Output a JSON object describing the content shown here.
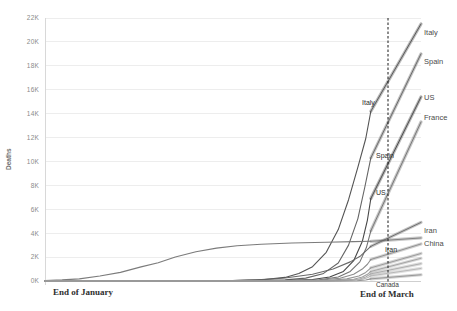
{
  "chart_data": {
    "type": "line",
    "title": "",
    "xlabel": "",
    "ylabel": "Deaths",
    "ylim": [
      0,
      22000
    ],
    "grid": true,
    "legend_position": "right-of-plot-inline-labels",
    "y_ticks": [
      "0K",
      "2K",
      "4K",
      "6K",
      "8K",
      "10K",
      "12K",
      "14K",
      "16K",
      "18K",
      "20K",
      "22K"
    ],
    "y_tick_values": [
      0,
      2000,
      4000,
      6000,
      8000,
      10000,
      12000,
      14000,
      16000,
      18000,
      20000,
      22000
    ],
    "x_annotations": [
      {
        "label": "End of January",
        "x_frac": 0.07
      },
      {
        "label": "End of March",
        "x_frac": 0.95
      }
    ],
    "now_marker": {
      "label": "End of March",
      "x_frac": 0.95
    },
    "x_domain_note": "Time from before End of January through End of March, with short projections past End of March",
    "series": [
      {
        "name": "Italy",
        "color": "#4a4a4a",
        "end_value": 14200,
        "projection_end_value": 21500,
        "points": [
          [
            0.0,
            0
          ],
          [
            0.2,
            0
          ],
          [
            0.4,
            10
          ],
          [
            0.55,
            40
          ],
          [
            0.64,
            120
          ],
          [
            0.7,
            300
          ],
          [
            0.74,
            620
          ],
          [
            0.78,
            1200
          ],
          [
            0.82,
            2400
          ],
          [
            0.855,
            4300
          ],
          [
            0.885,
            6800
          ],
          [
            0.912,
            9500
          ],
          [
            0.935,
            11900
          ],
          [
            0.95,
            14200
          ]
        ]
      },
      {
        "name": "Spain",
        "color": "#5c5c5c",
        "end_value": 10300,
        "projection_end_value": 19000,
        "points": [
          [
            0.0,
            0
          ],
          [
            0.3,
            0
          ],
          [
            0.5,
            10
          ],
          [
            0.62,
            30
          ],
          [
            0.7,
            90
          ],
          [
            0.76,
            240
          ],
          [
            0.81,
            600
          ],
          [
            0.855,
            1500
          ],
          [
            0.885,
            3000
          ],
          [
            0.912,
            5200
          ],
          [
            0.932,
            7800
          ],
          [
            0.95,
            10300
          ]
        ]
      },
      {
        "name": "US",
        "color": "#3d3d3d",
        "end_value": 6900,
        "projection_end_value": 15400,
        "points": [
          [
            0.0,
            0
          ],
          [
            0.45,
            0
          ],
          [
            0.6,
            15
          ],
          [
            0.7,
            45
          ],
          [
            0.78,
            120
          ],
          [
            0.83,
            330
          ],
          [
            0.87,
            800
          ],
          [
            0.9,
            1700
          ],
          [
            0.925,
            3300
          ],
          [
            0.94,
            5100
          ],
          [
            0.95,
            6900
          ]
        ]
      },
      {
        "name": "France",
        "color": "#6b6b6b",
        "end_value": 4200,
        "projection_end_value": 13300,
        "points": [
          [
            0.0,
            0
          ],
          [
            0.45,
            0
          ],
          [
            0.62,
            10
          ],
          [
            0.72,
            35
          ],
          [
            0.8,
            110
          ],
          [
            0.855,
            330
          ],
          [
            0.89,
            800
          ],
          [
            0.918,
            1600
          ],
          [
            0.937,
            2800
          ],
          [
            0.95,
            4200
          ]
        ]
      },
      {
        "name": "China",
        "color": "#747474",
        "end_value": 3320,
        "projection_end_value": 3600,
        "points": [
          [
            0.0,
            40
          ],
          [
            0.05,
            90
          ],
          [
            0.1,
            180
          ],
          [
            0.16,
            420
          ],
          [
            0.22,
            720
          ],
          [
            0.28,
            1180
          ],
          [
            0.33,
            1520
          ],
          [
            0.38,
            2000
          ],
          [
            0.44,
            2450
          ],
          [
            0.5,
            2750
          ],
          [
            0.56,
            2950
          ],
          [
            0.63,
            3080
          ],
          [
            0.72,
            3180
          ],
          [
            0.82,
            3240
          ],
          [
            0.9,
            3290
          ],
          [
            0.95,
            3320
          ]
        ]
      },
      {
        "name": "Iran",
        "color": "#616161",
        "end_value": 2900,
        "projection_end_value": 4900,
        "points": [
          [
            0.0,
            0
          ],
          [
            0.4,
            0
          ],
          [
            0.52,
            20
          ],
          [
            0.62,
            90
          ],
          [
            0.7,
            250
          ],
          [
            0.78,
            560
          ],
          [
            0.84,
            1000
          ],
          [
            0.89,
            1600
          ],
          [
            0.92,
            2100
          ],
          [
            0.95,
            2900
          ]
        ]
      },
      {
        "name": "UK",
        "color": "#858585",
        "end_value": 1800,
        "projection_end_value": 3100,
        "points": [
          [
            0.0,
            0
          ],
          [
            0.55,
            0
          ],
          [
            0.7,
            15
          ],
          [
            0.8,
            70
          ],
          [
            0.86,
            230
          ],
          [
            0.9,
            560
          ],
          [
            0.925,
            1000
          ],
          [
            0.94,
            1400
          ],
          [
            0.95,
            1800
          ]
        ]
      },
      {
        "name": "Netherlands",
        "color": "#909090",
        "end_value": 1100,
        "projection_end_value": 2300,
        "points": [
          [
            0.0,
            0
          ],
          [
            0.6,
            0
          ],
          [
            0.74,
            10
          ],
          [
            0.83,
            60
          ],
          [
            0.88,
            180
          ],
          [
            0.915,
            420
          ],
          [
            0.935,
            720
          ],
          [
            0.95,
            1100
          ]
        ]
      },
      {
        "name": "Germany",
        "color": "#9a9a9a",
        "end_value": 800,
        "projection_end_value": 1900,
        "points": [
          [
            0.0,
            0
          ],
          [
            0.62,
            0
          ],
          [
            0.76,
            8
          ],
          [
            0.85,
            45
          ],
          [
            0.9,
            150
          ],
          [
            0.925,
            340
          ],
          [
            0.94,
            560
          ],
          [
            0.95,
            800
          ]
        ]
      },
      {
        "name": "Belgium",
        "color": "#a5a5a5",
        "end_value": 600,
        "projection_end_value": 1450,
        "points": [
          [
            0.0,
            0
          ],
          [
            0.66,
            0
          ],
          [
            0.79,
            8
          ],
          [
            0.87,
            40
          ],
          [
            0.915,
            150
          ],
          [
            0.935,
            330
          ],
          [
            0.95,
            600
          ]
        ]
      },
      {
        "name": "Switzerland",
        "color": "#b0b0b0",
        "end_value": 430,
        "projection_end_value": 1050,
        "points": [
          [
            0.0,
            0
          ],
          [
            0.7,
            0
          ],
          [
            0.82,
            8
          ],
          [
            0.89,
            45
          ],
          [
            0.925,
            150
          ],
          [
            0.94,
            270
          ],
          [
            0.95,
            430
          ]
        ]
      },
      {
        "name": "Canada",
        "color": "#8c8c8c",
        "end_value": 180,
        "projection_end_value": 520,
        "points": [
          [
            0.0,
            0
          ],
          [
            0.75,
            0
          ],
          [
            0.86,
            5
          ],
          [
            0.91,
            25
          ],
          [
            0.935,
            85
          ],
          [
            0.95,
            180
          ]
        ]
      }
    ],
    "right_labels": [
      {
        "name": "Italy",
        "y": 35
      },
      {
        "name": "Spain",
        "y": 64
      },
      {
        "name": "US",
        "y": 100
      },
      {
        "name": "France",
        "y": 120
      },
      {
        "name": "Iran",
        "y": 233
      },
      {
        "name": "China",
        "y": 246
      }
    ],
    "inline_labels": [
      {
        "name": "Italy",
        "x": 362,
        "y": 105
      },
      {
        "name": "Spain",
        "x": 376,
        "y": 158
      },
      {
        "name": "US",
        "x": 376,
        "y": 195
      },
      {
        "name": "Iran",
        "x": 385,
        "y": 252
      },
      {
        "name": "Canada",
        "x": 376,
        "y": 287
      }
    ]
  },
  "axis": {
    "y_title": "Deaths"
  }
}
